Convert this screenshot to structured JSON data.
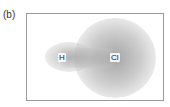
{
  "panel_label": "(b)",
  "diagram": {
    "atoms": [
      {
        "symbol": "H"
      },
      {
        "symbol": "Cl"
      }
    ],
    "colors": {
      "frame": "#9a9a9a",
      "cloud": "#a0a0a0"
    }
  }
}
